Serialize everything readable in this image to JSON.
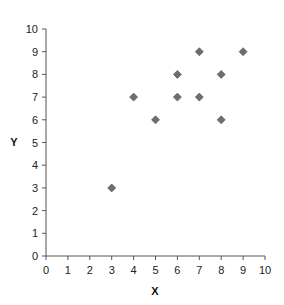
{
  "chart_data": {
    "type": "scatter",
    "title": "",
    "xlabel": "X",
    "ylabel": "Y",
    "xlim": [
      0,
      10
    ],
    "ylim": [
      0,
      10
    ],
    "x_ticks": [
      0,
      1,
      2,
      3,
      4,
      5,
      6,
      7,
      8,
      9,
      10
    ],
    "y_ticks": [
      0,
      1,
      2,
      3,
      4,
      5,
      6,
      7,
      8,
      9,
      10
    ],
    "grid": false,
    "legend": null,
    "marker": "diamond",
    "marker_color": "#6e6e6e",
    "series": [
      {
        "name": "",
        "points": [
          {
            "x": 3,
            "y": 3
          },
          {
            "x": 4,
            "y": 7
          },
          {
            "x": 5,
            "y": 6
          },
          {
            "x": 6,
            "y": 8
          },
          {
            "x": 6,
            "y": 7
          },
          {
            "x": 7,
            "y": 9
          },
          {
            "x": 7,
            "y": 7
          },
          {
            "x": 8,
            "y": 8
          },
          {
            "x": 8,
            "y": 6
          },
          {
            "x": 9,
            "y": 9
          }
        ]
      }
    ]
  },
  "colors": {
    "axis": "#555555",
    "marker_fill": "#6e6e6e",
    "marker_stroke": "#4a4a4a"
  }
}
